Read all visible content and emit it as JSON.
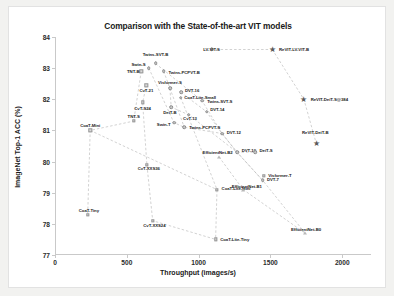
{
  "chart": {
    "title": "Comparison with the State-of-the-art VIT models",
    "xlabel": "Throughput (images/s)",
    "ylabel": "ImageNet Top-1 ACC (%)"
  },
  "chart_data": {
    "type": "scatter",
    "title": "Comparison with the State-of-the-art VIT models",
    "xlabel": "Throughput (images/s)",
    "ylabel": "ImageNet Top-1 ACC (%)",
    "xlim": [
      0,
      2200
    ],
    "ylim": [
      77,
      84
    ],
    "xticks": [
      "0",
      "500",
      "1000",
      "1500",
      "2000"
    ],
    "xtick_values": [
      0,
      500,
      1000,
      1500,
      2000
    ],
    "yticks": [
      "77",
      "78",
      "79",
      "80",
      "81",
      "82",
      "83",
      "84"
    ],
    "ytick_values": [
      77,
      78,
      79,
      80,
      81,
      82,
      83,
      84
    ],
    "grid": false,
    "legend": "none",
    "series": [
      {
        "name": "ReVIT (ours)",
        "marker": "star",
        "points": [
          {
            "label": "ReVIT-LV-VIT-B",
            "x": 1513,
            "y": 83.6,
            "lx": 1560,
            "ly": 83.6,
            "lpos": "right"
          },
          {
            "label": "ReVIT-DeiT-S@384",
            "x": 1733,
            "y": 82.0,
            "lx": 1780,
            "ly": 82.0,
            "lpos": "right"
          },
          {
            "label": "ReVIT-DeiT-B",
            "x": 1818,
            "y": 80.6,
            "lx": 1812,
            "ly": 80.95,
            "lpos": "center"
          }
        ]
      },
      {
        "name": "Transformer baselines",
        "marker": "circle",
        "points": [
          {
            "label": "Twins-SVT-B",
            "x": 700,
            "y": 83.15,
            "lx": 700,
            "ly": 83.45,
            "lpos": "center"
          },
          {
            "label": "Swin-S",
            "x": 653,
            "y": 83.0,
            "lx": 630,
            "ly": 83.12,
            "lpos": "left"
          },
          {
            "label": "Twins-PCPVT-B",
            "x": 757,
            "y": 82.9,
            "lx": 790,
            "ly": 82.88,
            "lpos": "right"
          },
          {
            "label": "Visformer-S",
            "x": 800,
            "y": 82.35,
            "lx": 800,
            "ly": 82.55,
            "lpos": "center"
          },
          {
            "label": "DVT-16",
            "x": 877,
            "y": 82.22,
            "lx": 905,
            "ly": 82.3,
            "lpos": "right"
          },
          {
            "label": "CoaT-Lite-Small",
            "x": 876,
            "y": 82.05,
            "lx": 900,
            "ly": 82.08,
            "lpos": "right"
          },
          {
            "label": "Twins-SVT-S",
            "x": 1024,
            "y": 81.95,
            "lx": 1060,
            "ly": 81.95,
            "lpos": "right"
          },
          {
            "label": "DeiT-B",
            "x": 809,
            "y": 81.75,
            "lx": 800,
            "ly": 81.6,
            "lpos": "center"
          },
          {
            "label": "DVT-14",
            "x": 1055,
            "y": 81.6,
            "lx": 1080,
            "ly": 81.68,
            "lpos": "right"
          },
          {
            "label": "CvT-13",
            "x": 932,
            "y": 81.5,
            "lx": 940,
            "ly": 81.4,
            "lpos": "center"
          },
          {
            "label": "Twins-PCPVT-S",
            "x": 900,
            "y": 81.1,
            "lx": 935,
            "ly": 81.12,
            "lpos": "right"
          },
          {
            "label": "Swin-T",
            "x": 828,
            "y": 81.25,
            "lx": 805,
            "ly": 81.2,
            "lpos": "left"
          },
          {
            "label": "DVT-12",
            "x": 1163,
            "y": 80.9,
            "lx": 1195,
            "ly": 80.95,
            "lpos": "right"
          },
          {
            "label": "DVT-10",
            "x": 1267,
            "y": 80.3,
            "lx": 1300,
            "ly": 80.38,
            "lpos": "right"
          },
          {
            "label": "DeiT-S",
            "x": 1394,
            "y": 80.3,
            "lx": 1424,
            "ly": 80.38,
            "lpos": "right"
          },
          {
            "label": "DVT-7",
            "x": 1445,
            "y": 79.4,
            "lx": 1476,
            "ly": 79.45,
            "lpos": "right"
          },
          {
            "label": "LV-VIT-S",
            "x": 1090,
            "y": 83.6,
            "lx": 1090,
            "ly": 83.6,
            "lpos": "center"
          }
        ]
      },
      {
        "name": "CvT / CoaT / TNT",
        "marker": "square",
        "points": [
          {
            "label": "TNT-B",
            "x": 600,
            "y": 82.9,
            "lx": 588,
            "ly": 82.9,
            "lpos": "left"
          },
          {
            "label": "CvT-21",
            "x": 636,
            "y": 82.45,
            "lx": 636,
            "ly": 82.3,
            "lpos": "center"
          },
          {
            "label": "CvT-S24",
            "x": 610,
            "y": 81.9,
            "lx": 610,
            "ly": 81.72,
            "lpos": "center"
          },
          {
            "label": "TNT-S",
            "x": 548,
            "y": 81.3,
            "lx": 548,
            "ly": 81.45,
            "lpos": "center"
          },
          {
            "label": "CoaT-Mini",
            "x": 245,
            "y": 81.0,
            "lx": 245,
            "ly": 81.18,
            "lpos": "center"
          },
          {
            "label": "CvT-XXS36",
            "x": 640,
            "y": 79.9,
            "lx": 653,
            "ly": 79.8,
            "lpos": "center"
          },
          {
            "label": "CoaT-Lite-Mini",
            "x": 1128,
            "y": 79.1,
            "lx": 1160,
            "ly": 79.15,
            "lpos": "right"
          },
          {
            "label": "CoaT-Tiny",
            "x": 228,
            "y": 78.3,
            "lx": 236,
            "ly": 78.45,
            "lpos": "center"
          },
          {
            "label": "CvT-XXS24",
            "x": 680,
            "y": 78.1,
            "lx": 692,
            "ly": 77.97,
            "lpos": "center"
          },
          {
            "label": "CoaT-Lite-Tiny",
            "x": 1118,
            "y": 77.5,
            "lx": 1150,
            "ly": 77.52,
            "lpos": "right"
          },
          {
            "label": "Visformer-T",
            "x": 1452,
            "y": 79.55,
            "lx": 1484,
            "ly": 79.58,
            "lpos": "right"
          }
        ]
      },
      {
        "name": "EfficientNet",
        "marker": "triangle",
        "points": [
          {
            "label": "EfficientNet-B2",
            "x": 1142,
            "y": 80.15,
            "lx": 1132,
            "ly": 80.3,
            "lpos": "center"
          },
          {
            "label": "EfficientNet-B1",
            "x": 1310,
            "y": 79.1,
            "lx": 1336,
            "ly": 79.2,
            "lpos": "center"
          },
          {
            "label": "EfficientNet-B0",
            "x": 1742,
            "y": 77.7,
            "lx": 1748,
            "ly": 77.82,
            "lpos": "center"
          }
        ]
      }
    ]
  }
}
